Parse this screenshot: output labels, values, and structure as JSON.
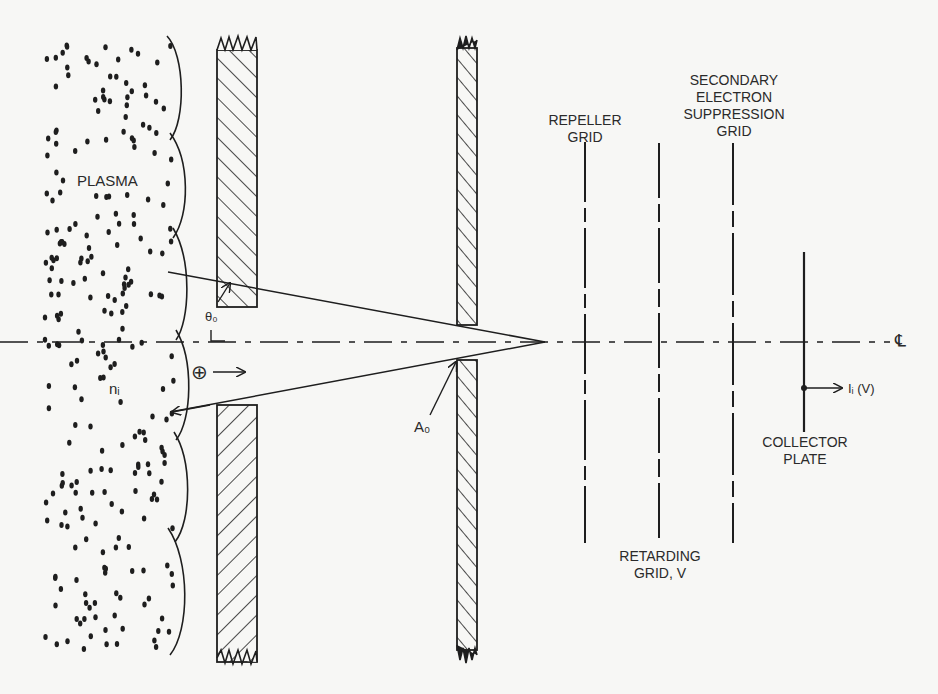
{
  "figure": {
    "ink_color": "#1e1e1e",
    "background": "#f7f7f5"
  },
  "labels": {
    "plasma": "PLASMA",
    "ion_density": "nᵢ",
    "acceptance_angle": "θ₀",
    "aperture_area": "A₀",
    "repeller_grid": [
      "REPELLER",
      "GRID"
    ],
    "suppression_grid": [
      "SECONDARY",
      "ELECTRON",
      "SUPPRESSION",
      "GRID"
    ],
    "retarding_grid": [
      "RETARDING",
      "GRID, V"
    ],
    "collector_plate": [
      "COLLECTOR",
      "PLATE"
    ],
    "collector_current": "Iᵢ (V)",
    "centerline": "℄",
    "ion_symbol": "⊕"
  },
  "components": [
    {
      "name": "plasma-sheath-region"
    },
    {
      "name": "entrance-wall-slab"
    },
    {
      "name": "aperture-plate"
    },
    {
      "name": "repeller-grid"
    },
    {
      "name": "retarding-grid"
    },
    {
      "name": "secondary-electron-suppression-grid"
    },
    {
      "name": "collector-plate"
    }
  ]
}
